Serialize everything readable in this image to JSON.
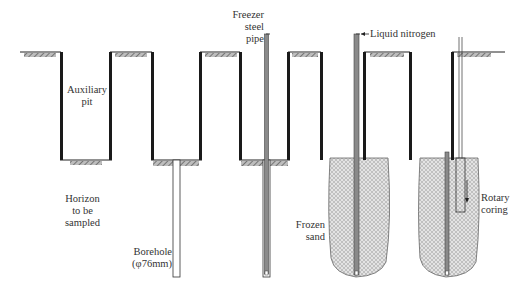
{
  "diagram": {
    "stages": [
      {
        "id": 1,
        "description": "Auxiliary pit excavated"
      },
      {
        "id": 2,
        "description": "Borehole drilled from pit bottom"
      },
      {
        "id": 3,
        "description": "Freezer steel pipe inserted"
      },
      {
        "id": 4,
        "description": "Liquid nitrogen injected to form frozen sand"
      },
      {
        "id": 5,
        "description": "Rotary coring of frozen sand"
      }
    ],
    "labels": {
      "auxiliary_pit": [
        "Auxiliary",
        "pit"
      ],
      "horizon": [
        "Horizon",
        "to be",
        "sampled"
      ],
      "borehole": [
        "Borehole",
        "(φ76mm)"
      ],
      "freezer_pipe": [
        "Freezer",
        "steel",
        "pipe"
      ],
      "liquid_nitrogen": "Liquid nitrogen",
      "frozen_sand": [
        "Frozen",
        "sand"
      ],
      "rotary_coring": [
        "Rotary",
        "coring"
      ]
    },
    "colors": {
      "wall": "#1a1a1a",
      "hatch": "#777777",
      "frozen_fill": "#d9d9d9",
      "pipe": "#8a8a8a",
      "text": "#333333"
    }
  }
}
